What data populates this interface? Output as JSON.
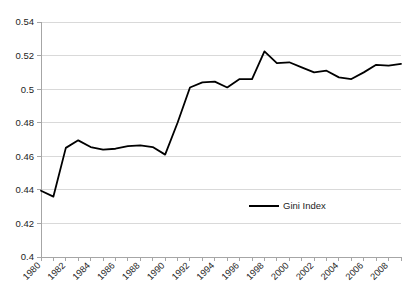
{
  "figure": {
    "clipped_top_text": "",
    "background_color": "#ffffff",
    "series_color": "#000000",
    "grid_color": "#d9d9d9",
    "axis_color": "#a6a6a6"
  },
  "legend": {
    "position": "inside-center-lower",
    "entries": [
      {
        "label": "Gini Index",
        "color": "#000000"
      }
    ]
  },
  "chart_data": {
    "type": "line",
    "title": "",
    "xlabel": "",
    "ylabel": "",
    "ylim": [
      0.4,
      0.54
    ],
    "xlim": [
      1980,
      2009
    ],
    "ytick_step": 0.02,
    "grid": true,
    "grid_axis": "y",
    "legend_position": "center",
    "ytick_labels": [
      "0.4",
      "0.42",
      "0.44",
      "0.46",
      "0.48",
      "0.5",
      "0.52",
      "0.54"
    ],
    "ytick_values": [
      0.4,
      0.42,
      0.44,
      0.46,
      0.48,
      0.5,
      0.52,
      0.54
    ],
    "xtick_labels": [
      "1980",
      "1982",
      "1984",
      "1986",
      "1988",
      "1990",
      "1992",
      "1994",
      "1996",
      "1998",
      "2000",
      "2002",
      "2004",
      "2006",
      "2008"
    ],
    "xtick_values": [
      1980,
      1982,
      1984,
      1986,
      1988,
      1990,
      1992,
      1994,
      1996,
      1998,
      2000,
      2002,
      2004,
      2006,
      2008
    ],
    "xtick_label_rotation": -45,
    "minor_xticks_every": 1,
    "categories": [
      1980,
      1981,
      1982,
      1983,
      1984,
      1985,
      1986,
      1987,
      1988,
      1989,
      1990,
      1991,
      1992,
      1993,
      1994,
      1995,
      1996,
      1997,
      1998,
      1999,
      2000,
      2001,
      2002,
      2003,
      2004,
      2005,
      2006,
      2007,
      2008,
      2009
    ],
    "series": [
      {
        "name": "Gini Index",
        "color": "#000000",
        "values": [
          0.4395,
          0.436,
          0.465,
          0.4695,
          0.4655,
          0.464,
          0.4645,
          0.466,
          0.4665,
          0.4655,
          0.461,
          0.48,
          0.501,
          0.504,
          0.5045,
          0.501,
          0.506,
          0.506,
          0.5225,
          0.5155,
          0.516,
          0.513,
          0.51,
          0.511,
          0.507,
          0.506,
          0.51,
          0.5145,
          0.514,
          0.515
        ]
      }
    ]
  }
}
